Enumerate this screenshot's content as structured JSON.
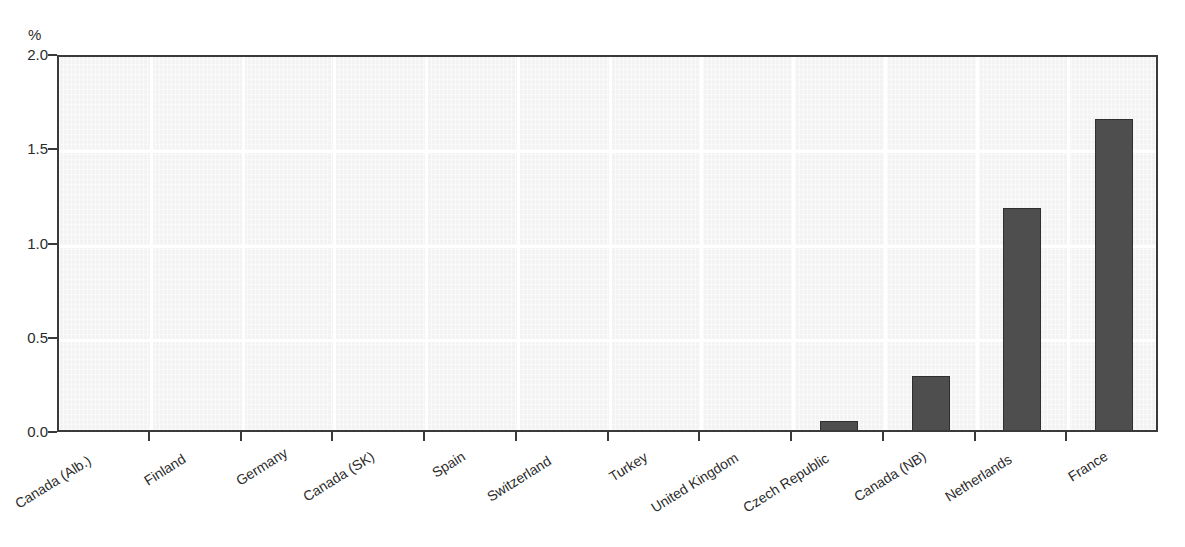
{
  "chart_data": {
    "type": "bar",
    "title": "",
    "subtitle": "",
    "xlabel": "",
    "ylabel": "%",
    "unit_label": "%",
    "ylim": [
      0.0,
      2.0
    ],
    "ytick_labels": [
      "2.0",
      "1.5",
      "1.0",
      "0.5",
      "0.0"
    ],
    "ytick_values": [
      2.0,
      1.5,
      1.0,
      0.5,
      0.0
    ],
    "grid": true,
    "grid_color": "#ffffff",
    "legend": null,
    "bar_color": "#4e4e4e",
    "plot_background": "#f3f3f3",
    "categories": [
      "Canada (Alb.)",
      "Finland",
      "Germany",
      "Canada (SK)",
      "Spain",
      "Switzerland",
      "Turkey",
      "United Kingdom",
      "Czech Republic",
      "Canada (NB)",
      "Netherlands",
      "France"
    ],
    "values": [
      0.0,
      0.0,
      0.0,
      0.0,
      0.0,
      0.0,
      0.0,
      0.0,
      0.07,
      0.31,
      1.2,
      1.67
    ]
  }
}
